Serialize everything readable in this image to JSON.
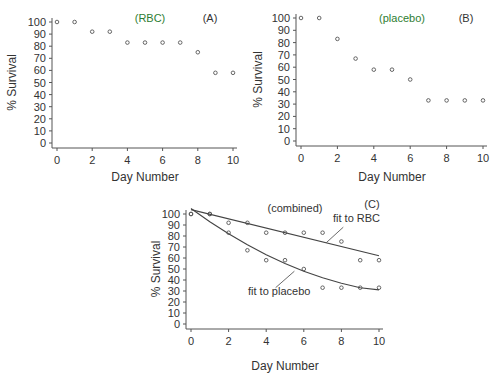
{
  "chart_data": [
    {
      "type": "scatter",
      "panel": "A",
      "title": "(RBC)",
      "panel_label": "(A)",
      "xlabel": "Day Number",
      "ylabel": "% Survival",
      "xlim": [
        0,
        10
      ],
      "ylim": [
        0,
        100
      ],
      "xticks": [
        0,
        2,
        4,
        6,
        8,
        10
      ],
      "yticks": [
        0,
        10,
        20,
        30,
        40,
        50,
        60,
        70,
        80,
        90,
        100
      ],
      "grid": false,
      "x": [
        0,
        1,
        2,
        3,
        4,
        5,
        6,
        7,
        8,
        9,
        10
      ],
      "y": [
        100,
        100,
        92,
        92,
        83,
        83,
        83,
        83,
        75,
        58,
        58
      ]
    },
    {
      "type": "scatter",
      "panel": "B",
      "title": "(placebo)",
      "panel_label": "(B)",
      "xlabel": "Day Number",
      "ylabel": "% Survival",
      "xlim": [
        0,
        10
      ],
      "ylim": [
        0,
        100
      ],
      "xticks": [
        0,
        2,
        4,
        6,
        8,
        10
      ],
      "yticks": [
        0,
        10,
        20,
        30,
        40,
        50,
        60,
        70,
        80,
        90,
        100
      ],
      "grid": false,
      "x": [
        0,
        1,
        2,
        3,
        4,
        5,
        6,
        7,
        8,
        9,
        10
      ],
      "y": [
        100,
        100,
        83,
        67,
        58,
        58,
        50,
        33,
        33,
        33,
        33
      ]
    },
    {
      "type": "scatter",
      "panel": "C",
      "title": "(combined)",
      "panel_label": "(C)",
      "xlabel": "Day Number",
      "ylabel": "% Survival",
      "xlim": [
        0,
        10
      ],
      "ylim": [
        0,
        100
      ],
      "xticks": [
        0,
        2,
        4,
        6,
        8,
        10
      ],
      "yticks": [
        0,
        10,
        20,
        30,
        40,
        50,
        60,
        70,
        80,
        90,
        100
      ],
      "grid": false,
      "series": [
        {
          "name": "RBC",
          "x": [
            0,
            1,
            2,
            3,
            4,
            5,
            6,
            7,
            8,
            9,
            10
          ],
          "y": [
            100,
            100,
            92,
            92,
            83,
            83,
            83,
            83,
            75,
            58,
            58
          ]
        },
        {
          "name": "placebo",
          "x": [
            0,
            1,
            2,
            3,
            4,
            5,
            6,
            7,
            8,
            9,
            10
          ],
          "y": [
            100,
            100,
            83,
            67,
            58,
            58,
            50,
            33,
            33,
            33,
            33
          ]
        }
      ],
      "fits": [
        {
          "name": "fit to RBC",
          "type": "line",
          "x": [
            0,
            10
          ],
          "y": [
            104,
            62
          ]
        },
        {
          "name": "fit to placebo",
          "type": "curve",
          "x": [
            0,
            1,
            2,
            3,
            4,
            5,
            6,
            7,
            8,
            9,
            10
          ],
          "y": [
            105,
            93,
            82,
            72,
            63,
            55,
            48,
            42,
            37,
            33,
            31
          ]
        }
      ],
      "annotations": [
        "fit to RBC",
        "fit to placebo"
      ]
    }
  ]
}
